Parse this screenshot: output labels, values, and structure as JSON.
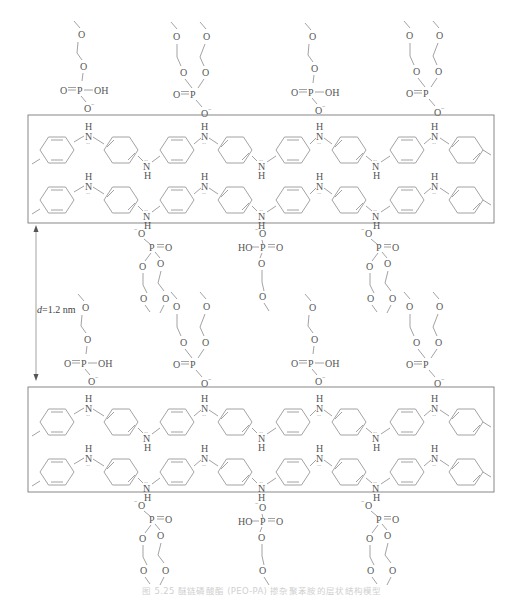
{
  "figure": {
    "caption": "图 5.25  醚链磷酸酯 (PEO-PA) 掺杂聚苯胺的层状结构模型",
    "spacing_label_var": "d",
    "spacing_label_value": "=1.2 nm",
    "atoms": {
      "N": "N",
      "H": "H",
      "O": "O",
      "P": "P",
      "OH": "OH",
      "HO": "HO",
      "O_minus": "O",
      "minus": "−",
      "lone_pair": "··"
    }
  },
  "layers": [
    {
      "name": "polyaniline-layer-1",
      "chains": 2,
      "rings_per_chain": 8
    },
    {
      "name": "polyaniline-layer-2",
      "chains": 2,
      "rings_per_chain": 8
    }
  ],
  "dopant_rows": [
    {
      "name": "dopants-above-layer-1",
      "types": [
        "mono-ester",
        "di-ester",
        "mono-ester",
        "di-ester"
      ]
    },
    {
      "name": "dopants-below-layer-1",
      "types": [
        "di-ester",
        "mono-ester",
        "di-ester"
      ]
    },
    {
      "name": "dopants-above-layer-2",
      "types": [
        "mono-ester",
        "di-ester",
        "mono-ester",
        "di-ester"
      ]
    },
    {
      "name": "dopants-below-layer-2",
      "types": [
        "di-ester",
        "mono-ester",
        "di-ester"
      ]
    }
  ]
}
